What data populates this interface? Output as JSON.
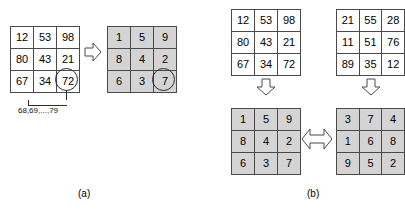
{
  "figure": {
    "caption_a": "(a)",
    "caption_b": "(b)",
    "range_label": "68,69,...,79"
  },
  "panel_a": {
    "source_grid": {
      "name": "original-values-grid",
      "shaded": false,
      "rows": [
        [
          "12",
          "53",
          "98"
        ],
        [
          "80",
          "43",
          "21"
        ],
        [
          "67",
          "34",
          "72"
        ]
      ],
      "highlighted_cell": {
        "row": 2,
        "col": 2,
        "value": "72"
      }
    },
    "arrow": {
      "name": "right-arrow",
      "direction": "right",
      "glyph": "⇒"
    },
    "result_grid": {
      "name": "rank-values-grid",
      "shaded": true,
      "rows": [
        [
          "1",
          "5",
          "9"
        ],
        [
          "8",
          "4",
          "2"
        ],
        [
          "6",
          "3",
          "7"
        ]
      ],
      "highlighted_cell": {
        "row": 2,
        "col": 2,
        "value": "7"
      }
    }
  },
  "panel_b": {
    "top_left_grid": {
      "name": "block-one-values-grid",
      "shaded": false,
      "rows": [
        [
          "12",
          "53",
          "98"
        ],
        [
          "80",
          "43",
          "21"
        ],
        [
          "67",
          "34",
          "72"
        ]
      ]
    },
    "top_right_grid": {
      "name": "block-two-values-grid",
      "shaded": false,
      "rows": [
        [
          "21",
          "55",
          "28"
        ],
        [
          "11",
          "51",
          "76"
        ],
        [
          "89",
          "35",
          "12"
        ]
      ]
    },
    "bottom_left_grid": {
      "name": "block-one-rank-grid",
      "shaded": true,
      "rows": [
        [
          "1",
          "5",
          "9"
        ],
        [
          "8",
          "4",
          "2"
        ],
        [
          "6",
          "3",
          "7"
        ]
      ]
    },
    "bottom_right_grid": {
      "name": "block-two-rank-grid",
      "shaded": true,
      "rows": [
        [
          "3",
          "7",
          "4"
        ],
        [
          "1",
          "6",
          "8"
        ],
        [
          "9",
          "5",
          "2"
        ]
      ]
    },
    "arrow_down_left": {
      "name": "down-arrow-left",
      "direction": "down",
      "glyph": "⇓"
    },
    "arrow_down_right": {
      "name": "down-arrow-right",
      "direction": "down",
      "glyph": "⇓"
    },
    "arrow_compare": {
      "name": "bidirectional-arrow",
      "direction": "both",
      "glyph": "⇔"
    }
  }
}
